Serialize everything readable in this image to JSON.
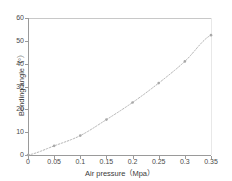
{
  "chart_data": {
    "type": "line",
    "title": "",
    "xlabel": "Air pressure（Mpa）",
    "ylabel": "Bending angle（°）",
    "xlim": [
      0,
      0.35
    ],
    "ylim": [
      0,
      60
    ],
    "grid": false,
    "legend": null,
    "x": [
      0,
      0.05,
      0.1,
      0.15,
      0.2,
      0.25,
      0.3,
      0.35
    ],
    "values": [
      0,
      4,
      8.5,
      15.5,
      23,
      31.5,
      41,
      52.5
    ],
    "series": [
      {
        "name": "Bending angle",
        "x": [
          0,
          0.05,
          0.1,
          0.15,
          0.2,
          0.25,
          0.3,
          0.35
        ],
        "values": [
          0,
          4,
          8.5,
          15.5,
          23,
          31.5,
          41,
          52.5
        ],
        "color": "#b4b4b4",
        "linestyle": "dotted",
        "marker": "dot"
      }
    ],
    "xticks": [
      0,
      0.05,
      0.1,
      0.15,
      0.2,
      0.25,
      0.3,
      0.35
    ],
    "xticklabels": [
      "0",
      "0.05",
      "0.1",
      "0.15",
      "0.2",
      "0.25",
      "0.3",
      "0.35"
    ],
    "yticks": [
      0,
      10,
      20,
      30,
      40,
      50,
      60
    ],
    "yticklabels": [
      "0",
      "10",
      "20",
      "30",
      "40",
      "50",
      "60"
    ],
    "line_color": "#b4b4b4",
    "axis_color": "#9a9a9a",
    "text_color": "#4a4a4a",
    "background": "#ffffff"
  }
}
